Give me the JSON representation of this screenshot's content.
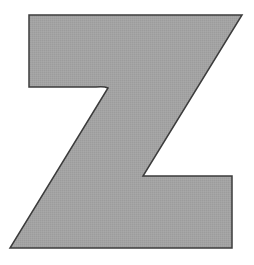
{
  "figure": {
    "letter": "Z",
    "colors": {
      "fill": "#a3a3a3",
      "stroke": "#3c3c3c",
      "background": "#ffffff"
    }
  }
}
